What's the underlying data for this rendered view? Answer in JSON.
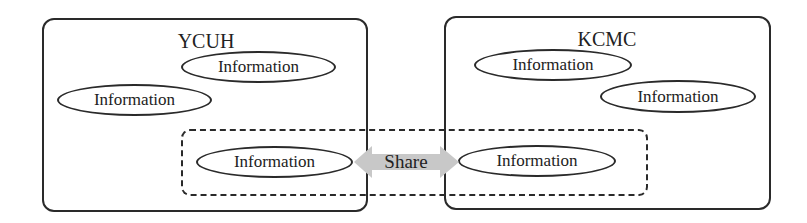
{
  "diagram": {
    "organizations": [
      {
        "name": "YCUH",
        "information_nodes": [
          "Information",
          "Information",
          "Information"
        ]
      },
      {
        "name": "KCMC",
        "information_nodes": [
          "Information",
          "Information",
          "Information"
        ]
      }
    ],
    "shared_region": {
      "label": "Share",
      "arrow": "double-headed-arrow",
      "arrow_color": "#c8c8c8"
    },
    "colors": {
      "stroke": "#2a2a2a",
      "background": "#ffffff"
    }
  }
}
